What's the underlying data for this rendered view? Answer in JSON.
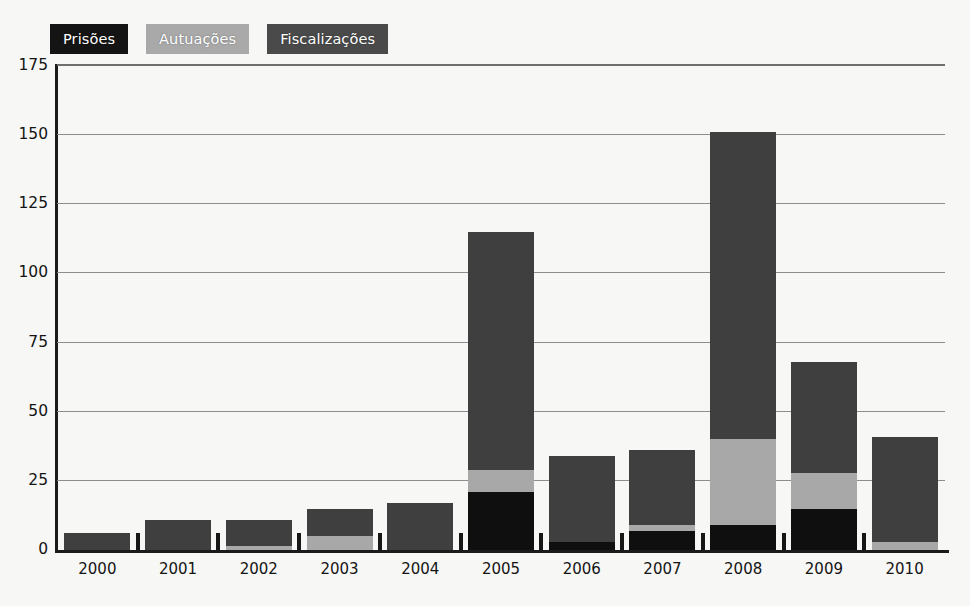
{
  "chart_data": {
    "type": "bar",
    "subtype": "stacked-vertical-bar",
    "title": "",
    "subtitle": "",
    "xlabel": "",
    "ylabel": "",
    "categories": [
      "2000",
      "2001",
      "2002",
      "2003",
      "2004",
      "2005",
      "2006",
      "2007",
      "2008",
      "2009",
      "2010"
    ],
    "series": [
      {
        "name": "Prisões",
        "color": "#0f0f0f",
        "values": [
          0,
          0,
          0,
          0,
          0,
          21,
          3,
          7,
          9,
          15,
          0
        ]
      },
      {
        "name": "Autuações",
        "color": "#a8a8a8",
        "values": [
          0,
          0,
          1.5,
          5,
          0,
          8,
          0,
          2,
          31,
          13,
          3
        ]
      },
      {
        "name": "Fiscalizações",
        "color": "#3f3f3f",
        "values": [
          6,
          11,
          9.5,
          10,
          17,
          86,
          31,
          27,
          111,
          40,
          38
        ]
      }
    ],
    "totals": [
      6,
      11,
      11,
      15,
      17,
      115,
      34,
      36,
      151,
      68,
      41
    ],
    "ylim": [
      0,
      175
    ],
    "yticks": [
      0,
      25,
      50,
      75,
      100,
      125,
      150,
      175
    ],
    "ytick_labels": [
      "0",
      "25",
      "50",
      "75",
      "100",
      "125",
      "150",
      "175"
    ],
    "grid": true,
    "grid_axis": "y",
    "legend_position": "top-left",
    "legend": [
      {
        "label": "Prisões",
        "box_color": "#141414",
        "text_color": "#ffffff"
      },
      {
        "label": "Autuações",
        "box_color": "#a9a9a9",
        "text_color": "#ffffff"
      },
      {
        "label": "Fiscalizações",
        "box_color": "#4a4a4a",
        "text_color": "#ffffff"
      }
    ]
  },
  "colors": {
    "background": "#f7f7f5",
    "axis": "#1b1b1b",
    "gridline": "#8d8d8d",
    "prisoes": "#0f0f0f",
    "autuacoes": "#a8a8a8",
    "fiscalizacoes": "#3f3f3f"
  }
}
